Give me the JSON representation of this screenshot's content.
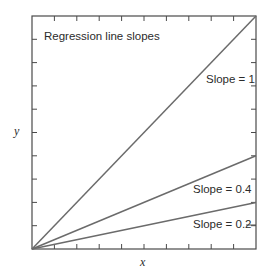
{
  "chart_data": {
    "type": "line",
    "title": "Regression line slopes",
    "xlabel": "x",
    "ylabel": "y",
    "xlim": [
      0,
      10
    ],
    "ylim": [
      0,
      10
    ],
    "grid": false,
    "ticks": {
      "x_count": 10,
      "y_count": 10,
      "tick_labels": false
    },
    "series": [
      {
        "name": "Slope = 1",
        "slope": 1,
        "x": [
          0,
          10
        ],
        "y": [
          0,
          10
        ]
      },
      {
        "name": "Slope = 0.4",
        "slope": 0.4,
        "x": [
          0,
          10
        ],
        "y": [
          0,
          4
        ]
      },
      {
        "name": "Slope = 0.2",
        "slope": 0.2,
        "x": [
          0,
          10
        ],
        "y": [
          0,
          2
        ]
      }
    ],
    "annotations": [
      "Slope = 1",
      "Slope = 0.4",
      "Slope = 0.2"
    ],
    "colors": {
      "line": "#6b6b6b",
      "axis": "#4a4a4a",
      "text": "#2b2b2b"
    }
  },
  "labels": {
    "title": "Regression line slopes",
    "xlabel": "x",
    "ylabel": "y",
    "slope1": "Slope = 1",
    "slope04": "Slope = 0.4",
    "slope02": "Slope = 0.2"
  }
}
